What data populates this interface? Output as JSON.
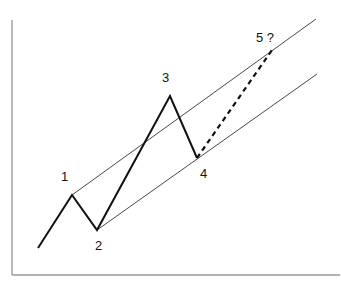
{
  "diagram": {
    "title": "",
    "type": "elliott-wave-channel",
    "labels": {
      "p1": "1",
      "p2": "2",
      "p3": "3",
      "p4": "4",
      "p5": "5 ?"
    },
    "colors": {
      "axis": "#8a8a8a",
      "wave": "#111111",
      "channel": "#333333",
      "projection": "#111111"
    }
  }
}
